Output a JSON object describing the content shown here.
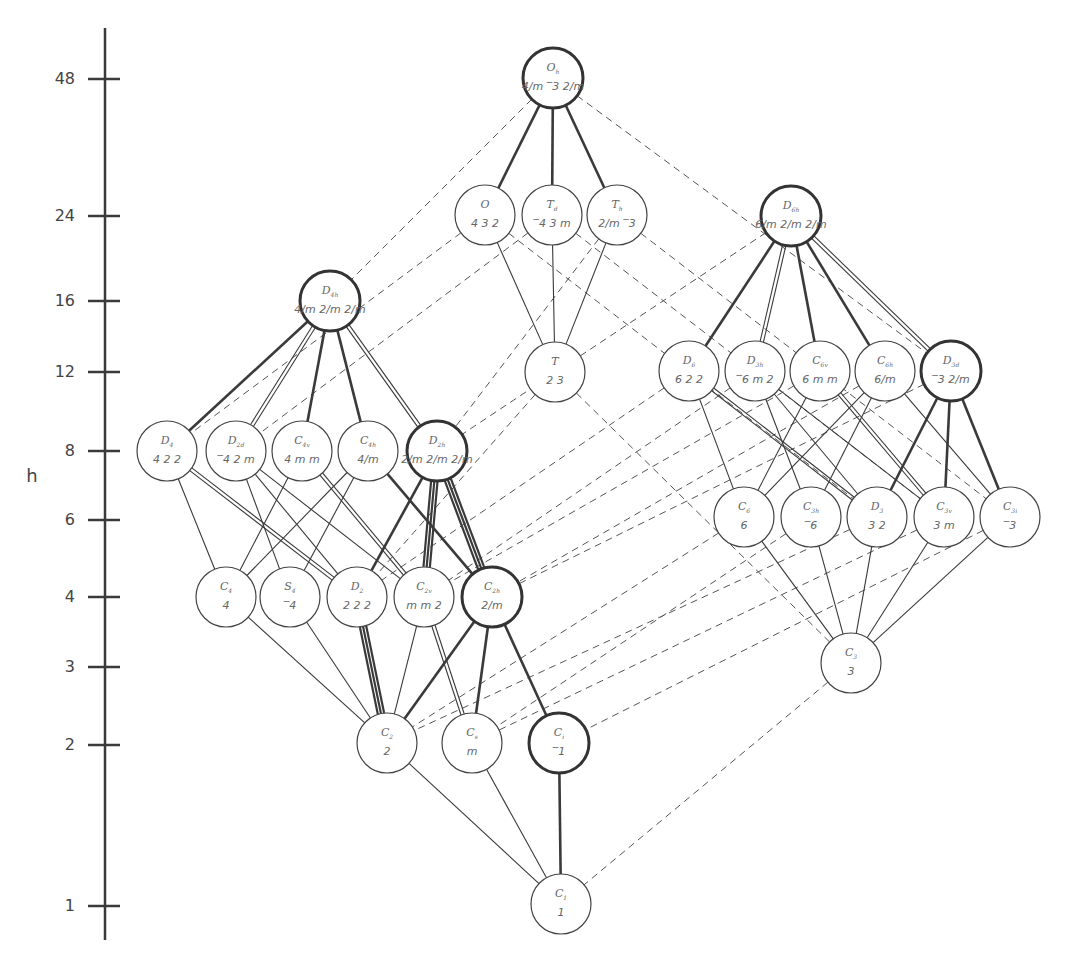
{
  "diagram": {
    "axis": {
      "label": "h",
      "ticks": [
        {
          "value": "48",
          "y": 79
        },
        {
          "value": "24",
          "y": 216
        },
        {
          "value": "16",
          "y": 301
        },
        {
          "value": "12",
          "y": 372
        },
        {
          "value": "8",
          "y": 451
        },
        {
          "value": "6",
          "y": 520
        },
        {
          "value": "4",
          "y": 597
        },
        {
          "value": "3",
          "y": 667
        },
        {
          "value": "2",
          "y": 745
        },
        {
          "value": "1",
          "y": 906
        }
      ]
    },
    "nodes": [
      {
        "id": "Oh",
        "letter": "O",
        "sub": "h",
        "symbol": "4/m ‾3 2/m",
        "order": 48,
        "x": 553,
        "y": 78,
        "bold": true
      },
      {
        "id": "O",
        "letter": "O",
        "sub": "",
        "symbol": "4 3 2",
        "order": 24,
        "x": 485,
        "y": 215,
        "bold": false
      },
      {
        "id": "Td",
        "letter": "T",
        "sub": "d",
        "symbol": "‾4 3 m",
        "order": 24,
        "x": 552,
        "y": 215,
        "bold": false
      },
      {
        "id": "Th",
        "letter": "T",
        "sub": "h",
        "symbol": "2/m ‾3",
        "order": 24,
        "x": 617,
        "y": 215,
        "bold": false
      },
      {
        "id": "D6h",
        "letter": "D",
        "sub": "6h",
        "symbol": "6/m 2/m 2/m",
        "order": 24,
        "x": 791,
        "y": 216,
        "bold": true
      },
      {
        "id": "D4h",
        "letter": "D",
        "sub": "4h",
        "symbol": "4/m 2/m 2/m",
        "order": 16,
        "x": 330,
        "y": 301,
        "bold": true
      },
      {
        "id": "T",
        "letter": "T",
        "sub": "",
        "symbol": "2 3",
        "order": 12,
        "x": 555,
        "y": 372,
        "bold": false
      },
      {
        "id": "D6",
        "letter": "D",
        "sub": "6",
        "symbol": "6 2 2",
        "order": 12,
        "x": 689,
        "y": 371,
        "bold": false
      },
      {
        "id": "D3h",
        "letter": "D",
        "sub": "3h",
        "symbol": "‾6 m 2",
        "order": 12,
        "x": 755,
        "y": 371,
        "bold": false
      },
      {
        "id": "C6v",
        "letter": "C",
        "sub": "6v",
        "symbol": "6 m m",
        "order": 12,
        "x": 820,
        "y": 371,
        "bold": false
      },
      {
        "id": "C6h",
        "letter": "C",
        "sub": "6h",
        "symbol": "6/m",
        "order": 12,
        "x": 885,
        "y": 371,
        "bold": false
      },
      {
        "id": "D3d",
        "letter": "D",
        "sub": "3d",
        "symbol": "‾3 2/m",
        "order": 12,
        "x": 951,
        "y": 371,
        "bold": true
      },
      {
        "id": "D4",
        "letter": "D",
        "sub": "4",
        "symbol": "4 2 2",
        "order": 8,
        "x": 167,
        "y": 451,
        "bold": false
      },
      {
        "id": "D2d",
        "letter": "D",
        "sub": "2d",
        "symbol": "‾4 2 m",
        "order": 8,
        "x": 236,
        "y": 451,
        "bold": false
      },
      {
        "id": "C4v",
        "letter": "C",
        "sub": "4v",
        "symbol": "4 m m",
        "order": 8,
        "x": 302,
        "y": 451,
        "bold": false
      },
      {
        "id": "C4h",
        "letter": "C",
        "sub": "4h",
        "symbol": "4/m",
        "order": 8,
        "x": 368,
        "y": 451,
        "bold": false
      },
      {
        "id": "D2h",
        "letter": "D",
        "sub": "2h",
        "symbol": "2/m 2/m 2/m",
        "order": 8,
        "x": 437,
        "y": 451,
        "bold": true
      },
      {
        "id": "C6",
        "letter": "C",
        "sub": "6",
        "symbol": "6",
        "order": 6,
        "x": 744,
        "y": 517,
        "bold": false
      },
      {
        "id": "C3h",
        "letter": "C",
        "sub": "3h",
        "symbol": "‾6",
        "order": 6,
        "x": 811,
        "y": 517,
        "bold": false
      },
      {
        "id": "D3",
        "letter": "D",
        "sub": "3",
        "symbol": "3 2",
        "order": 6,
        "x": 877,
        "y": 517,
        "bold": false
      },
      {
        "id": "C3v",
        "letter": "C",
        "sub": "3v",
        "symbol": "3 m",
        "order": 6,
        "x": 944,
        "y": 517,
        "bold": false
      },
      {
        "id": "C3i",
        "letter": "C",
        "sub": "3i",
        "symbol": "‾3",
        "order": 6,
        "x": 1010,
        "y": 517,
        "bold": false
      },
      {
        "id": "C4",
        "letter": "C",
        "sub": "4",
        "symbol": "4",
        "order": 4,
        "x": 226,
        "y": 597,
        "bold": false
      },
      {
        "id": "S4",
        "letter": "S",
        "sub": "4",
        "symbol": "‾4",
        "order": 4,
        "x": 290,
        "y": 597,
        "bold": false
      },
      {
        "id": "D2",
        "letter": "D",
        "sub": "2",
        "symbol": "2 2 2",
        "order": 4,
        "x": 357,
        "y": 597,
        "bold": false
      },
      {
        "id": "C2v",
        "letter": "C",
        "sub": "2v",
        "symbol": "m m 2",
        "order": 4,
        "x": 424,
        "y": 597,
        "bold": false
      },
      {
        "id": "C2h",
        "letter": "C",
        "sub": "2h",
        "symbol": "2/m",
        "order": 4,
        "x": 492,
        "y": 597,
        "bold": true
      },
      {
        "id": "C3",
        "letter": "C",
        "sub": "3",
        "symbol": "3",
        "order": 3,
        "x": 851,
        "y": 663,
        "bold": false
      },
      {
        "id": "C2",
        "letter": "C",
        "sub": "2",
        "symbol": "2",
        "order": 2,
        "x": 387,
        "y": 743,
        "bold": false
      },
      {
        "id": "Cs",
        "letter": "C",
        "sub": "s",
        "symbol": "m",
        "order": 2,
        "x": 472,
        "y": 743,
        "bold": false
      },
      {
        "id": "Ci",
        "letter": "C",
        "sub": "i",
        "symbol": "‾1",
        "order": 2,
        "x": 559,
        "y": 743,
        "bold": true
      },
      {
        "id": "C1",
        "letter": "C",
        "sub": "1",
        "symbol": "1",
        "order": 1,
        "x": 561,
        "y": 904,
        "bold": false
      }
    ],
    "edges": {
      "solid": [
        [
          "Oh",
          "O",
          1
        ],
        [
          "Oh",
          "Td",
          1
        ],
        [
          "Oh",
          "Th",
          1
        ],
        [
          "O",
          "T",
          1
        ],
        [
          "Td",
          "T",
          1
        ],
        [
          "Th",
          "T",
          1
        ],
        [
          "D6h",
          "D6",
          1
        ],
        [
          "D6h",
          "D3h",
          2
        ],
        [
          "D6h",
          "C6v",
          1
        ],
        [
          "D6h",
          "C6h",
          1
        ],
        [
          "D6h",
          "D3d",
          2
        ],
        [
          "D4h",
          "D4",
          1
        ],
        [
          "D4h",
          "D2d",
          2
        ],
        [
          "D4h",
          "C4v",
          1
        ],
        [
          "D4h",
          "C4h",
          1
        ],
        [
          "D4h",
          "D2h",
          2
        ],
        [
          "D6",
          "C6",
          1
        ],
        [
          "D6",
          "D3",
          2
        ],
        [
          "D3h",
          "C3h",
          1
        ],
        [
          "D3h",
          "D3",
          1
        ],
        [
          "D3h",
          "C3v",
          1
        ],
        [
          "C6v",
          "C6",
          1
        ],
        [
          "C6v",
          "C3v",
          2
        ],
        [
          "C6h",
          "C6",
          1
        ],
        [
          "C6h",
          "C3h",
          1
        ],
        [
          "C6h",
          "C3i",
          1
        ],
        [
          "D3d",
          "D3",
          1
        ],
        [
          "D3d",
          "C3v",
          1
        ],
        [
          "D3d",
          "C3i",
          1
        ],
        [
          "D4",
          "C4",
          1
        ],
        [
          "D4",
          "D2",
          2
        ],
        [
          "D2d",
          "S4",
          1
        ],
        [
          "D2d",
          "D2",
          1
        ],
        [
          "D2d",
          "C2v",
          1
        ],
        [
          "C4v",
          "C4",
          1
        ],
        [
          "C4v",
          "C2v",
          2
        ],
        [
          "C4h",
          "C4",
          1
        ],
        [
          "C4h",
          "S4",
          1
        ],
        [
          "C4h",
          "C2h",
          1
        ],
        [
          "D2h",
          "D2",
          1
        ],
        [
          "D2h",
          "C2v",
          3
        ],
        [
          "D2h",
          "C2h",
          3
        ],
        [
          "C6",
          "C3",
          1
        ],
        [
          "C3h",
          "C3",
          1
        ],
        [
          "D3",
          "C3",
          1
        ],
        [
          "C3v",
          "C3",
          1
        ],
        [
          "C3i",
          "C3",
          1
        ],
        [
          "C4",
          "C2",
          1
        ],
        [
          "S4",
          "C2",
          1
        ],
        [
          "D2",
          "C2",
          3
        ],
        [
          "C2v",
          "C2",
          1
        ],
        [
          "C2v",
          "Cs",
          2
        ],
        [
          "C2h",
          "C2",
          1
        ],
        [
          "C2h",
          "Cs",
          1
        ],
        [
          "C2h",
          "Ci",
          1
        ],
        [
          "C2",
          "C1",
          1
        ],
        [
          "Cs",
          "C1",
          1
        ],
        [
          "Ci",
          "C1",
          1
        ]
      ],
      "dashed": [
        [
          "Oh",
          "D4h"
        ],
        [
          "Oh",
          "D3d"
        ],
        [
          "O",
          "D4"
        ],
        [
          "O",
          "D3"
        ],
        [
          "Td",
          "D2d"
        ],
        [
          "Td",
          "C3v"
        ],
        [
          "Th",
          "D2h"
        ],
        [
          "Th",
          "C3i"
        ],
        [
          "T",
          "D2"
        ],
        [
          "T",
          "C3"
        ],
        [
          "D6h",
          "D2h"
        ],
        [
          "D6",
          "D2"
        ],
        [
          "D3h",
          "C2v"
        ],
        [
          "C6v",
          "C2v"
        ],
        [
          "C6h",
          "C2h"
        ],
        [
          "D3d",
          "C2h"
        ],
        [
          "C6",
          "C2"
        ],
        [
          "C3h",
          "Cs"
        ],
        [
          "D3",
          "C2"
        ],
        [
          "C3v",
          "Cs"
        ],
        [
          "C3i",
          "Ci"
        ],
        [
          "C3",
          "C1"
        ]
      ]
    }
  }
}
